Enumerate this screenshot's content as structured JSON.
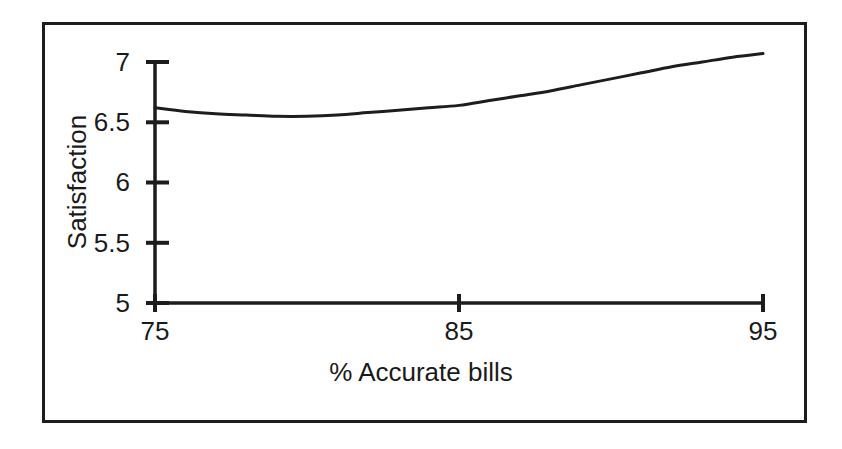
{
  "figure": {
    "background_color": "#ffffff",
    "frame_color": "#1d1d1d",
    "line_color": "#1d1d1d"
  },
  "axes": {
    "y_title": "Satisfaction",
    "x_title": "% Accurate bills",
    "y_ticks": [
      "5",
      "5.5",
      "6",
      "6.5",
      "7"
    ],
    "x_ticks": [
      "75",
      "85",
      "95"
    ]
  },
  "chart_data": {
    "type": "line",
    "title": "",
    "subtitle": "",
    "xlabel": "% Accurate bills",
    "ylabel": "Satisfaction",
    "xlim": [
      75,
      95
    ],
    "ylim": [
      5,
      7
    ],
    "xticks": [
      75,
      85,
      95
    ],
    "yticks": [
      5,
      5.5,
      6,
      6.5,
      7
    ],
    "grid": false,
    "legend": null,
    "annotations": [],
    "series": [
      {
        "name": "Satisfaction vs % accurate bills",
        "x": [
          75,
          76,
          77,
          78,
          79,
          80,
          81,
          82,
          83,
          84,
          85,
          86,
          87,
          88,
          89,
          90,
          91,
          92,
          93,
          94,
          95
        ],
        "values": [
          6.62,
          6.59,
          6.57,
          6.56,
          6.55,
          6.55,
          6.56,
          6.58,
          6.6,
          6.62,
          6.64,
          6.68,
          6.72,
          6.76,
          6.81,
          6.86,
          6.91,
          6.96,
          7.0,
          7.04,
          7.07
        ]
      }
    ]
  }
}
